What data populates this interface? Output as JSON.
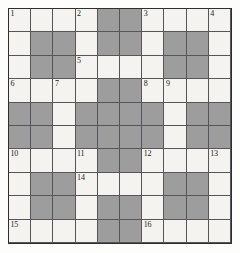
{
  "puzzle": {
    "type": "crossword-grid",
    "rows": 10,
    "cols": 10,
    "colors": {
      "open_cell": "#f4f3ef",
      "block_cell": "#9d9d9d",
      "grid_line": "#55555a",
      "border": "#2e2e2e",
      "number_text": "#1c1c1c",
      "page_background": "#fdfdfb"
    },
    "legend": {
      "open": "white answer cell",
      "block": "shaded blocked cell"
    },
    "grid": [
      [
        "open",
        "open",
        "open",
        "open",
        "block",
        "block",
        "open",
        "open",
        "open",
        "open"
      ],
      [
        "open",
        "block",
        "block",
        "open",
        "block",
        "block",
        "open",
        "block",
        "block",
        "open"
      ],
      [
        "open",
        "block",
        "block",
        "open",
        "open",
        "open",
        "open",
        "block",
        "block",
        "open"
      ],
      [
        "open",
        "open",
        "open",
        "open",
        "block",
        "block",
        "open",
        "open",
        "open",
        "open"
      ],
      [
        "block",
        "block",
        "open",
        "block",
        "block",
        "block",
        "block",
        "open",
        "block",
        "block"
      ],
      [
        "block",
        "block",
        "open",
        "block",
        "block",
        "block",
        "block",
        "open",
        "block",
        "block"
      ],
      [
        "open",
        "open",
        "open",
        "open",
        "block",
        "block",
        "open",
        "open",
        "open",
        "open"
      ],
      [
        "open",
        "block",
        "block",
        "open",
        "open",
        "open",
        "open",
        "block",
        "block",
        "open"
      ],
      [
        "open",
        "block",
        "block",
        "open",
        "block",
        "block",
        "open",
        "block",
        "block",
        "open"
      ],
      [
        "open",
        "open",
        "open",
        "open",
        "block",
        "block",
        "open",
        "open",
        "open",
        "open"
      ]
    ],
    "numbers": [
      {
        "row": 0,
        "col": 0,
        "label": "1"
      },
      {
        "row": 0,
        "col": 3,
        "label": "2"
      },
      {
        "row": 0,
        "col": 6,
        "label": "3"
      },
      {
        "row": 0,
        "col": 9,
        "label": "4"
      },
      {
        "row": 2,
        "col": 3,
        "label": "5"
      },
      {
        "row": 3,
        "col": 0,
        "label": "6"
      },
      {
        "row": 3,
        "col": 2,
        "label": "7"
      },
      {
        "row": 3,
        "col": 6,
        "label": "8"
      },
      {
        "row": 3,
        "col": 7,
        "label": "9"
      },
      {
        "row": 6,
        "col": 0,
        "label": "10"
      },
      {
        "row": 6,
        "col": 3,
        "label": "11"
      },
      {
        "row": 6,
        "col": 6,
        "label": "12"
      },
      {
        "row": 6,
        "col": 9,
        "label": "13"
      },
      {
        "row": 7,
        "col": 3,
        "label": "14"
      },
      {
        "row": 9,
        "col": 0,
        "label": "15"
      },
      {
        "row": 9,
        "col": 6,
        "label": "16"
      }
    ]
  }
}
